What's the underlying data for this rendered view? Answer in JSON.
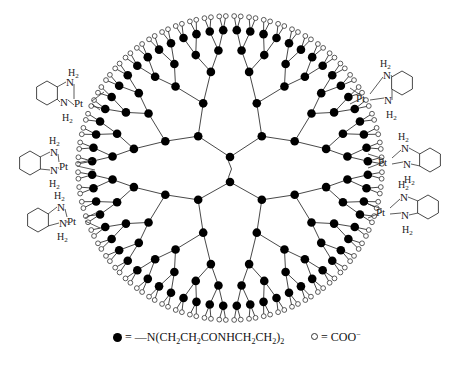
{
  "diagram": {
    "colors": {
      "line": "#333333",
      "node_fill": "#000000",
      "terminal_stroke": "#333333",
      "background": "#ffffff"
    },
    "structure": {
      "core_nodes": 2,
      "generations": 5,
      "terminal_group": "COO-"
    },
    "pt_complexes": [
      {
        "side": "left",
        "metal": "Pt",
        "n_top": "N",
        "h_top": "H2",
        "n_bottom": "N",
        "h_bottom": "H2"
      },
      {
        "side": "left",
        "metal": "Pt",
        "n_top": "N",
        "h_top": "H2",
        "n_bottom": "N",
        "h_bottom": "H2"
      },
      {
        "side": "left",
        "metal": "Pt",
        "n_top": "N",
        "h_top": "H2",
        "n_bottom": "N",
        "h_bottom": "H2"
      },
      {
        "side": "right",
        "metal": "Pt",
        "n_top": "N",
        "h_top": "H2",
        "n_bottom": "N",
        "h_bottom": "H2"
      },
      {
        "side": "right",
        "metal": "Pt",
        "n_top": "N",
        "h_top": "H2",
        "n_bottom": "N",
        "h_bottom": "H2"
      },
      {
        "side": "right",
        "metal": "Pt",
        "n_top": "N",
        "h_top": "H2",
        "n_bottom": "N",
        "h_bottom": "H2"
      }
    ]
  },
  "legend": {
    "filled": {
      "symbol": "filled-circle",
      "equals": "=",
      "dash": "—",
      "formula_parts": [
        "N(CH",
        "2",
        "CH",
        "2",
        "CONHCH",
        "2",
        "CH",
        "2",
        ")",
        "2"
      ]
    },
    "open": {
      "symbol": "open-circle",
      "equals": "=",
      "formula": "COO",
      "charge": "−"
    }
  }
}
